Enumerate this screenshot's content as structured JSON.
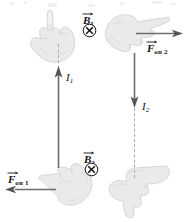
{
  "figure": {
    "background_color": "#ffffff",
    "width": 184,
    "height": 222
  },
  "colors": {
    "arrow": "#6b6b70",
    "dashed_wire": "#a8a8ad",
    "label_text": "#111114",
    "hand_fill": "#e9e9ea",
    "hand_stroke": "#cfcfd2"
  },
  "labels": {
    "b_field_1": {
      "symbol": "B",
      "subscript": "1",
      "vector": true
    },
    "b_field_2": {
      "symbol": "B",
      "subscript": "2",
      "vector": true
    },
    "force_on_1": {
      "symbol": "F",
      "subscript": "on 1",
      "vector": true
    },
    "force_on_2": {
      "symbol": "F",
      "subscript": "on 2",
      "vector": true
    },
    "current_1": {
      "symbol": "I",
      "subscript": "1"
    },
    "current_2": {
      "symbol": "I",
      "subscript": "2"
    }
  },
  "field_symbols": {
    "into_page_glyph": "x-in-circle",
    "count": 2
  },
  "wires": [
    {
      "name": "wire-1",
      "current_label": "I1",
      "direction": "up",
      "x": 58,
      "solid_top": 67,
      "solid_bottom": 168,
      "dashed_top": 44,
      "dashed_bottom": 67
    },
    {
      "name": "wire-2",
      "current_label": "I2",
      "direction": "down",
      "x": 134,
      "solid_top": 54,
      "solid_bottom": 106,
      "dashed_top": 106,
      "dashed_bottom": 176
    }
  ],
  "forces": [
    {
      "name": "force-on-1",
      "direction": "left",
      "label": "F on 1"
    },
    {
      "name": "force-on-2",
      "direction": "right",
      "label": "F on 2"
    }
  ],
  "hands": [
    {
      "name": "hand-top-left",
      "gesture": "index-finger-up"
    },
    {
      "name": "hand-top-right",
      "gesture": "index-finger-right"
    },
    {
      "name": "hand-bottom-left",
      "gesture": "index-finger-left"
    },
    {
      "name": "hand-bottom-right",
      "gesture": "index-finger-down"
    }
  ]
}
